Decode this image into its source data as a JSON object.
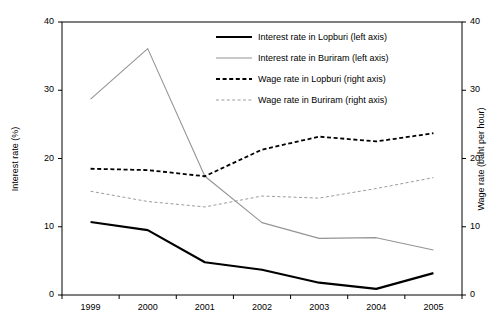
{
  "chart_data": {
    "type": "line",
    "title": "",
    "xlabel": "",
    "ylabel": "Interest rate (%)",
    "y2label": "Wage rate (baht per hour)",
    "categories": [
      "1999",
      "2000",
      "2001",
      "2002",
      "2003",
      "2004",
      "2005"
    ],
    "ylim": [
      0,
      40
    ],
    "y2lim": [
      0,
      40
    ],
    "yticks": [
      "0",
      "10",
      "20",
      "30",
      "40"
    ],
    "y2ticks": [
      "0",
      "10",
      "20",
      "30",
      "40"
    ],
    "grid": false,
    "legend_position": "upper-right-inside",
    "series": [
      {
        "name": "Interest rate in Lopburi (left axis)",
        "axis": "left",
        "style": "solid",
        "color": "#000000",
        "width": 2.2,
        "values": [
          10.7,
          9.5,
          4.8,
          3.7,
          1.8,
          0.9,
          3.2
        ]
      },
      {
        "name": "Interest rate in Buriram (left axis)",
        "axis": "left",
        "style": "solid",
        "color": "#949494",
        "width": 1.1,
        "values": [
          28.7,
          36.1,
          17.4,
          10.6,
          8.3,
          8.4,
          6.6
        ]
      },
      {
        "name": "Wage rate in Lopburi (right axis)",
        "axis": "right",
        "style": "dashed",
        "color": "#000000",
        "width": 1.8,
        "values": [
          18.5,
          18.3,
          17.4,
          21.3,
          23.2,
          22.5,
          23.7
        ]
      },
      {
        "name": "Wage rate in Buriram (right axis)",
        "axis": "right",
        "style": "dashed",
        "color": "#9c9c9c",
        "width": 1.0,
        "values": [
          15.2,
          13.7,
          12.9,
          14.5,
          14.2,
          15.6,
          17.2
        ]
      }
    ]
  },
  "axes": {
    "left_title": "Interest rate (%)",
    "right_title": "Wage rate (baht per hour)"
  },
  "legend": {
    "items": [
      {
        "label": "Interest rate in Lopburi (left axis)"
      },
      {
        "label": "Interest rate in Buriram (left axis)"
      },
      {
        "label": "Wage rate in Lopburi (right axis)"
      },
      {
        "label": "Wage rate in Buriram (right axis)"
      }
    ]
  },
  "colors": {
    "axis": "#000000",
    "dark_series": "#000000",
    "light_series": "#949494",
    "background": "#ffffff"
  }
}
